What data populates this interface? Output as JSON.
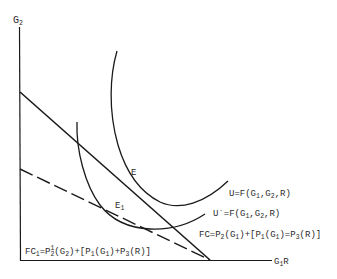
{
  "diagram": {
    "type": "economics indifference-curve diagram",
    "axes": {
      "y_label": "G",
      "y_label_sub": "2",
      "x_label": "G",
      "x_label_sub": "1",
      "x_label_suffix": "R"
    },
    "points": {
      "E": {
        "label": "E",
        "sub": ""
      },
      "E1": {
        "label": "E",
        "sub": "1"
      }
    },
    "curves": {
      "U": {
        "prefix": "U=F(G",
        "s1": "1",
        "mid": ",G",
        "s2": "2",
        "suffix": ",R)"
      },
      "U_prime": {
        "prefix": "U´=F(G",
        "s1": "1",
        "mid": ",G",
        "s2": "2",
        "suffix": ",R)"
      }
    },
    "budget_lines": {
      "FC": {
        "style": "solid",
        "t1": "FC=P",
        "s1": "2",
        "t2": "(G",
        "s2": "1",
        "t3": ")+[P",
        "s3": "1",
        "t4": "(G",
        "s4": "1",
        "t5": ")=P",
        "s5": "3",
        "t6": "(R)]"
      },
      "FC1": {
        "style": "dashed",
        "t0": "FC",
        "s0": "1",
        "t1": "=P",
        "sup1": "1",
        "s1": "2",
        "t2": "(G",
        "s2": "2",
        "t3": ")+[P",
        "s3": "1",
        "t4": "(G",
        "s4": "1",
        "t5": ")+P",
        "s5": "3",
        "t6": "(R)]"
      }
    },
    "colors": {
      "ink": "#1a1a1a",
      "background": "#ffffff"
    }
  }
}
